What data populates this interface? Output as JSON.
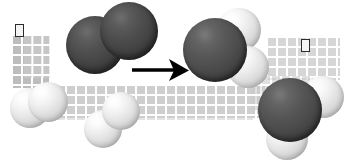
{
  "figure": {
    "equation": "2 H2 + O2 -> 2 H2O",
    "background_color": "#ffffff",
    "representation": "space-filling molecular model"
  },
  "legend": {
    "oxygen_color": "#4c4c4c",
    "hydrogen_color": "#f2f2f2",
    "arrow_color": "#000000",
    "grid_color": "#c9c9c9",
    "marker_border_color": "#2b2b2b"
  },
  "reactants": [
    {
      "name": "oxygen-molecule",
      "formula": "O2",
      "atoms": [
        {
          "element": "O",
          "label": "oxygen"
        },
        {
          "element": "O",
          "label": "oxygen"
        }
      ]
    },
    {
      "name": "hydrogen-molecule-left",
      "formula": "H2",
      "atoms": [
        {
          "element": "H",
          "label": "hydrogen"
        },
        {
          "element": "H",
          "label": "hydrogen"
        }
      ]
    },
    {
      "name": "hydrogen-molecule-center",
      "formula": "H2",
      "atoms": [
        {
          "element": "H",
          "label": "hydrogen"
        },
        {
          "element": "H",
          "label": "hydrogen"
        }
      ]
    }
  ],
  "arrow": {
    "name": "reaction-arrow",
    "direction": "right",
    "label": "yields"
  },
  "products": [
    {
      "name": "water-molecule-upper",
      "formula": "H2O",
      "atoms": [
        {
          "element": "O",
          "label": "oxygen"
        },
        {
          "element": "H",
          "label": "hydrogen"
        },
        {
          "element": "H",
          "label": "hydrogen"
        }
      ]
    },
    {
      "name": "water-molecule-lower",
      "formula": "H2O",
      "atoms": [
        {
          "element": "O",
          "label": "oxygen"
        },
        {
          "element": "H",
          "label": "hydrogen"
        },
        {
          "element": "H",
          "label": "hydrogen"
        }
      ]
    }
  ],
  "markers": [
    {
      "name": "marker-left",
      "state": "outlined"
    },
    {
      "name": "marker-right",
      "state": "outlined"
    }
  ],
  "grid_bands": [
    {
      "name": "grid-band-left-column"
    },
    {
      "name": "grid-band-middle"
    },
    {
      "name": "grid-band-right-upper"
    }
  ]
}
